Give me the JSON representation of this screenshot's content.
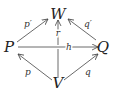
{
  "diagram": {
    "nodes": [
      {
        "id": "W",
        "label": "W"
      },
      {
        "id": "P",
        "label": "P"
      },
      {
        "id": "Q",
        "label": "Q"
      },
      {
        "id": "V",
        "label": "V"
      }
    ],
    "edges": [
      {
        "from": "P",
        "to": "W",
        "label": "p′",
        "style": "solid"
      },
      {
        "from": "Q",
        "to": "W",
        "label": "q′",
        "style": "solid"
      },
      {
        "from": "V",
        "to": "P",
        "label": "p",
        "style": "solid"
      },
      {
        "from": "V",
        "to": "Q",
        "label": "q",
        "style": "solid"
      },
      {
        "from": "P",
        "to": "Q",
        "label": "h",
        "style": "solid"
      },
      {
        "from": "V",
        "to": "W",
        "label": "r",
        "style": "dashed-above-crossing"
      }
    ]
  }
}
